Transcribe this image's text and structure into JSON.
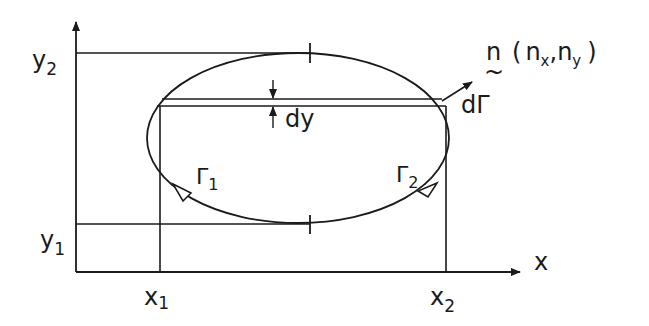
{
  "diagram": {
    "axes": {
      "x_label": "x",
      "y_label_top": "y",
      "y2_label": "y",
      "y2_sub": "2",
      "y1_label": "y",
      "y1_sub": "1",
      "x1_label": "x",
      "x1_sub": "1",
      "x2_label": "x",
      "x2_sub": "2"
    },
    "strip": {
      "label": "dy"
    },
    "contour": {
      "gamma1_label": "Γ",
      "gamma1_sub": "1",
      "gamma2_label": "Γ",
      "gamma2_sub": "2",
      "element_label": "dΓ"
    },
    "normal": {
      "vector_label": "n",
      "tilde": "~",
      "open": "(",
      "nx": "n",
      "nx_sub": "x",
      "comma": ",",
      "ny": "n",
      "ny_sub": "y",
      "close": ")"
    },
    "colors": {
      "stroke": "#1a1a1a",
      "background": "#ffffff"
    }
  }
}
